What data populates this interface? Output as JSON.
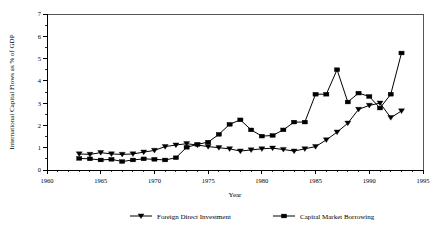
{
  "chart_data": {
    "type": "line",
    "title": "",
    "xlabel": "Year",
    "ylabel": "International Capital Flows as % of GDP",
    "xlim": [
      1960,
      1995
    ],
    "ylim": [
      0,
      7
    ],
    "xticks": [
      1960,
      1965,
      1970,
      1975,
      1980,
      1985,
      1990,
      1995
    ],
    "xticklabels": [
      "1960",
      "1965",
      "1970",
      "1975",
      "1980",
      "1985",
      "1990",
      "1995"
    ],
    "yticks": [
      0,
      1,
      2,
      3,
      4,
      5,
      6,
      7
    ],
    "yticklabels": [
      "0",
      "1",
      "2",
      "3",
      "4",
      "5",
      "6",
      "7"
    ],
    "xminorstep": 1,
    "yminorstep": 0.5,
    "grid": false,
    "legend_position": "bottom",
    "x": [
      1963,
      1964,
      1965,
      1966,
      1967,
      1968,
      1969,
      1970,
      1971,
      1972,
      1973,
      1974,
      1975,
      1976,
      1977,
      1978,
      1979,
      1980,
      1981,
      1982,
      1983,
      1984,
      1985,
      1986,
      1987,
      1988,
      1989,
      1990,
      1991,
      1992,
      1993
    ],
    "series": [
      {
        "name": "Foreign Direct Investment",
        "marker": "triangle-down",
        "values": [
          0.72,
          0.7,
          0.78,
          0.72,
          0.7,
          0.72,
          0.8,
          0.88,
          1.05,
          1.12,
          1.18,
          1.12,
          1.05,
          1.0,
          0.95,
          0.85,
          0.9,
          0.95,
          0.98,
          0.92,
          0.85,
          0.95,
          1.05,
          1.35,
          1.7,
          2.1,
          2.72,
          2.9,
          3.0,
          2.35,
          2.65
        ]
      },
      {
        "name": "Capital Market Borrowing",
        "marker": "square",
        "values": [
          0.52,
          0.5,
          0.45,
          0.48,
          0.38,
          0.45,
          0.5,
          0.48,
          0.45,
          0.55,
          1.02,
          1.15,
          1.25,
          1.6,
          2.05,
          2.25,
          1.8,
          1.52,
          1.55,
          1.8,
          2.15,
          2.15,
          3.4,
          3.4,
          4.5,
          3.05,
          3.45,
          3.3,
          2.78,
          3.4,
          5.25
        ]
      }
    ]
  },
  "legend": {
    "entries": [
      {
        "label": "Foreign Direct Investment",
        "marker": "triangle-down"
      },
      {
        "label": "Capital Market Borrowing",
        "marker": "square"
      }
    ]
  }
}
